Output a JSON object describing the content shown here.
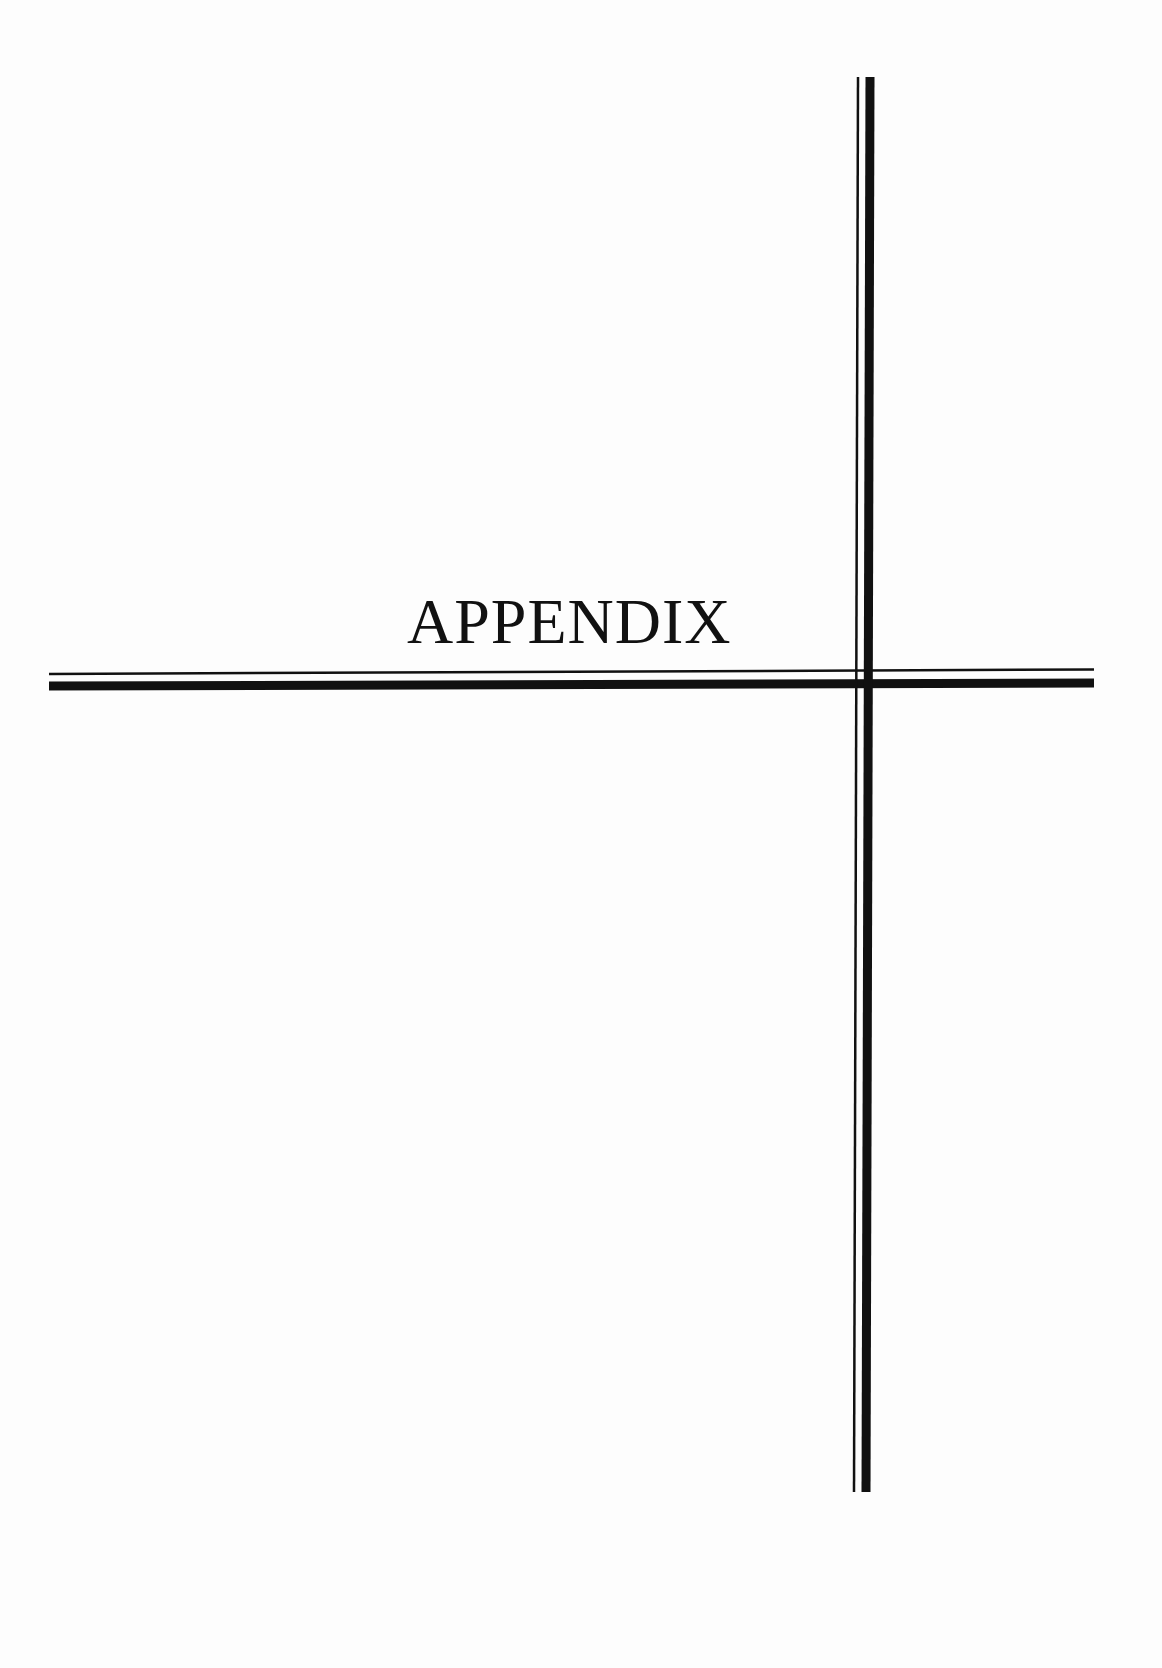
{
  "page": {
    "title": "APPENDIX",
    "line_color": "#111111",
    "background": "#fdfdfd"
  }
}
